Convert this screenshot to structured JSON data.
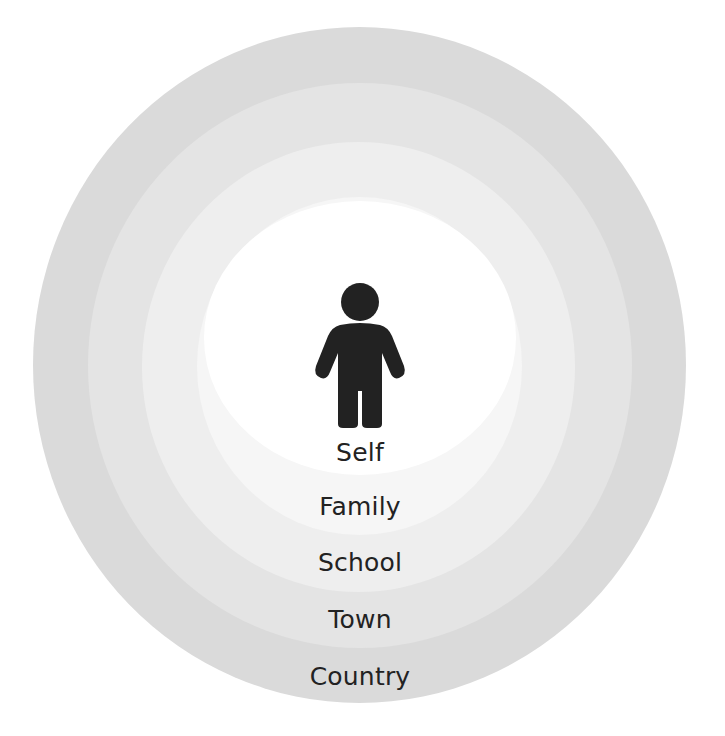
{
  "diagram": {
    "center_icon": "person-icon",
    "rings": [
      {
        "label": "Country",
        "color": "#dadada",
        "left": 33,
        "top": 27,
        "width": 653,
        "height": 676,
        "label_y": 662
      },
      {
        "label": "Town",
        "color": "#e4e4e4",
        "left": 88,
        "top": 83,
        "width": 544,
        "height": 565,
        "label_y": 605
      },
      {
        "label": "School",
        "color": "#eeeeee",
        "left": 142,
        "top": 142,
        "width": 433,
        "height": 450,
        "label_y": 548
      },
      {
        "label": "Family",
        "color": "#f6f6f6",
        "left": 197,
        "top": 197,
        "width": 325,
        "height": 338,
        "label_y": 492
      },
      {
        "label": "Self",
        "color": "#ffffff",
        "left": 204,
        "top": 201,
        "width": 312,
        "height": 274,
        "label_y": 438
      }
    ],
    "icon_color": "#222222"
  }
}
